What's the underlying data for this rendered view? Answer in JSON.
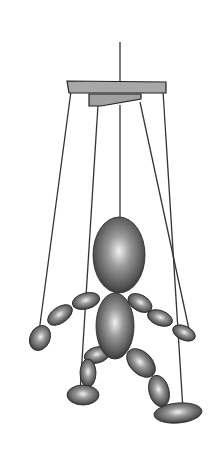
{
  "image": {
    "subject": "Marionette puppet hanging from wooden control bar by strings",
    "alt": "Grayscale illustration of a marionette made of ellipsoid segments suspended from a crossbar by strings",
    "colors": {
      "background": "#ffffff",
      "string": "#333333",
      "bar_fill": "#a8a8a8",
      "bar_stroke": "#222222",
      "body_light": "#f2f2f2",
      "body_mid": "#7a7a7a",
      "body_dark": "#2a2a2a"
    }
  }
}
